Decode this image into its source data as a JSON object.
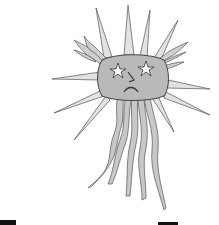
{
  "illustration": {
    "subject": "sad sun face with spiky and wavy rays",
    "colors": {
      "background": "#ffffff",
      "fill": "#b9b9b9",
      "ray_fill": "#d6d6d6",
      "outline": "#555555",
      "text": "#111111"
    },
    "face": {
      "eyes": "star-shaped",
      "nose": "angular",
      "mouth": "frown"
    }
  }
}
